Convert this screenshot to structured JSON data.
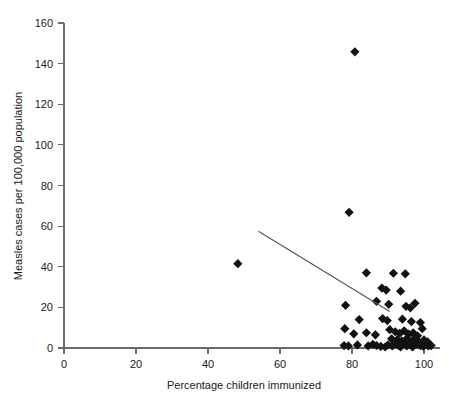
{
  "chart_data": {
    "type": "scatter",
    "title": "",
    "xlabel": "Percentage children immunized",
    "ylabel": "Measles cases per 100,000 population",
    "xlim": [
      0,
      104
    ],
    "ylim": [
      0,
      160
    ],
    "xticks": [
      0,
      20,
      40,
      60,
      80,
      100
    ],
    "yticks": [
      0,
      20,
      40,
      60,
      80,
      100,
      120,
      140,
      160
    ],
    "grid": false,
    "legend": null,
    "marker_shape": "diamond",
    "marker_color": "#111111",
    "trendline": {
      "label": "regression line",
      "color": "#555555",
      "x_start": 54.0,
      "y_start": 57.5,
      "x_end": 90.5,
      "y_end": 18.0
    },
    "points": [
      {
        "x": 48.3,
        "y": 41.5
      },
      {
        "x": 80.8,
        "y": 145.8
      },
      {
        "x": 79.2,
        "y": 66.8
      },
      {
        "x": 84.0,
        "y": 37.0
      },
      {
        "x": 91.5,
        "y": 36.8
      },
      {
        "x": 94.8,
        "y": 36.5
      },
      {
        "x": 88.3,
        "y": 29.5
      },
      {
        "x": 89.5,
        "y": 28.5
      },
      {
        "x": 93.5,
        "y": 28.0
      },
      {
        "x": 78.2,
        "y": 21.0
      },
      {
        "x": 86.8,
        "y": 23.0
      },
      {
        "x": 90.2,
        "y": 21.5
      },
      {
        "x": 95.0,
        "y": 20.5
      },
      {
        "x": 96.2,
        "y": 19.8
      },
      {
        "x": 97.5,
        "y": 22.0
      },
      {
        "x": 82.0,
        "y": 14.0
      },
      {
        "x": 88.5,
        "y": 14.5
      },
      {
        "x": 89.8,
        "y": 13.5
      },
      {
        "x": 94.0,
        "y": 14.2
      },
      {
        "x": 96.5,
        "y": 13.0
      },
      {
        "x": 99.0,
        "y": 12.5
      },
      {
        "x": 78.0,
        "y": 9.5
      },
      {
        "x": 80.5,
        "y": 7.0
      },
      {
        "x": 84.0,
        "y": 7.5
      },
      {
        "x": 86.5,
        "y": 6.5
      },
      {
        "x": 90.5,
        "y": 9.0
      },
      {
        "x": 92.0,
        "y": 8.0
      },
      {
        "x": 93.2,
        "y": 7.2
      },
      {
        "x": 94.5,
        "y": 8.5
      },
      {
        "x": 95.8,
        "y": 6.8
      },
      {
        "x": 97.0,
        "y": 7.5
      },
      {
        "x": 98.2,
        "y": 6.0
      },
      {
        "x": 99.5,
        "y": 9.5
      },
      {
        "x": 91.0,
        "y": 4.5
      },
      {
        "x": 92.5,
        "y": 4.0
      },
      {
        "x": 93.8,
        "y": 3.5
      },
      {
        "x": 95.0,
        "y": 4.2
      },
      {
        "x": 96.0,
        "y": 3.0
      },
      {
        "x": 97.2,
        "y": 4.5
      },
      {
        "x": 98.5,
        "y": 3.2
      },
      {
        "x": 100.0,
        "y": 4.0
      },
      {
        "x": 101.0,
        "y": 3.0
      },
      {
        "x": 77.8,
        "y": 1.2
      },
      {
        "x": 79.0,
        "y": 1.0
      },
      {
        "x": 81.5,
        "y": 1.5
      },
      {
        "x": 84.5,
        "y": 1.0
      },
      {
        "x": 85.8,
        "y": 1.8
      },
      {
        "x": 86.8,
        "y": 1.2
      },
      {
        "x": 90.0,
        "y": 1.5
      },
      {
        "x": 91.2,
        "y": 1.0
      },
      {
        "x": 92.2,
        "y": 2.0
      },
      {
        "x": 93.0,
        "y": 1.2
      },
      {
        "x": 94.0,
        "y": 1.8
      },
      {
        "x": 95.2,
        "y": 1.0
      },
      {
        "x": 96.2,
        "y": 1.5
      },
      {
        "x": 97.0,
        "y": 1.0
      },
      {
        "x": 98.0,
        "y": 1.8
      },
      {
        "x": 99.0,
        "y": 1.2
      },
      {
        "x": 100.2,
        "y": 1.5
      },
      {
        "x": 101.2,
        "y": 1.0
      },
      {
        "x": 102.0,
        "y": 1.2
      },
      {
        "x": 88.0,
        "y": 0.8
      },
      {
        "x": 89.2,
        "y": 0.5
      },
      {
        "x": 93.5,
        "y": 0.6
      },
      {
        "x": 96.8,
        "y": 0.5
      },
      {
        "x": 99.8,
        "y": 0.8
      }
    ]
  }
}
